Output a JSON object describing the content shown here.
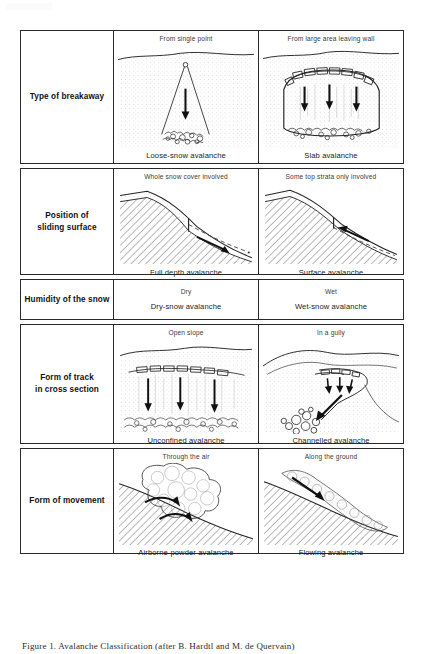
{
  "figure": {
    "caption": "Figure 1. Avalanche Classification (after B. Hardtl and M. de Quervain)",
    "corner_mark": ""
  },
  "table": {
    "rows": [
      {
        "category": "Type of breakaway",
        "cells": [
          {
            "top_label": "From single point",
            "bottom_label": "Loose-snow avalanche",
            "art": "loose-snow-avalanche-diagram"
          },
          {
            "top_label": "From large area leaving wall",
            "bottom_label": "Slab avalanche",
            "art": "slab-avalanche-diagram"
          }
        ]
      },
      {
        "category": "Position of\nsliding surface",
        "category_line1": "Position of",
        "category_line2": "sliding surface",
        "cells": [
          {
            "top_label": "Whole snow cover involved",
            "bottom_label": "Full depth avalanche",
            "art": "full-depth-avalanche-diagram"
          },
          {
            "top_label": "Some top strata only involved",
            "bottom_label": "Surface avalanche",
            "art": "surface-avalanche-diagram"
          }
        ]
      },
      {
        "category": "Humidity of the snow",
        "cells": [
          {
            "top_label": "Dry",
            "bottom_label": "Dry-snow avalanche",
            "art": "none"
          },
          {
            "top_label": "Wet",
            "bottom_label": "Wet-snow avalanche",
            "art": "none"
          }
        ]
      },
      {
        "category_line1": "Form of track",
        "category_line2": "in cross section",
        "cells": [
          {
            "top_label": "Open slope",
            "bottom_label": "Unconfined avalanche",
            "art": "unconfined-avalanche-diagram"
          },
          {
            "top_label": "In a gully",
            "bottom_label": "Channelled avalanche",
            "art": "channelled-avalanche-diagram"
          }
        ]
      },
      {
        "category": "Form of movement",
        "cells": [
          {
            "top_label": "Through the air",
            "bottom_label": "Airborne-powder avalanche",
            "art": "airborne-powder-avalanche-diagram"
          },
          {
            "top_label": "Along the ground",
            "bottom_label": "Flowing avalanche",
            "art": "flowing-avalanche-diagram"
          }
        ]
      }
    ]
  },
  "colors": {
    "border": "#2a2a2a",
    "ink": "#1a1a1a",
    "light_ink": "#3a3a3a",
    "background": "#ffffff"
  }
}
